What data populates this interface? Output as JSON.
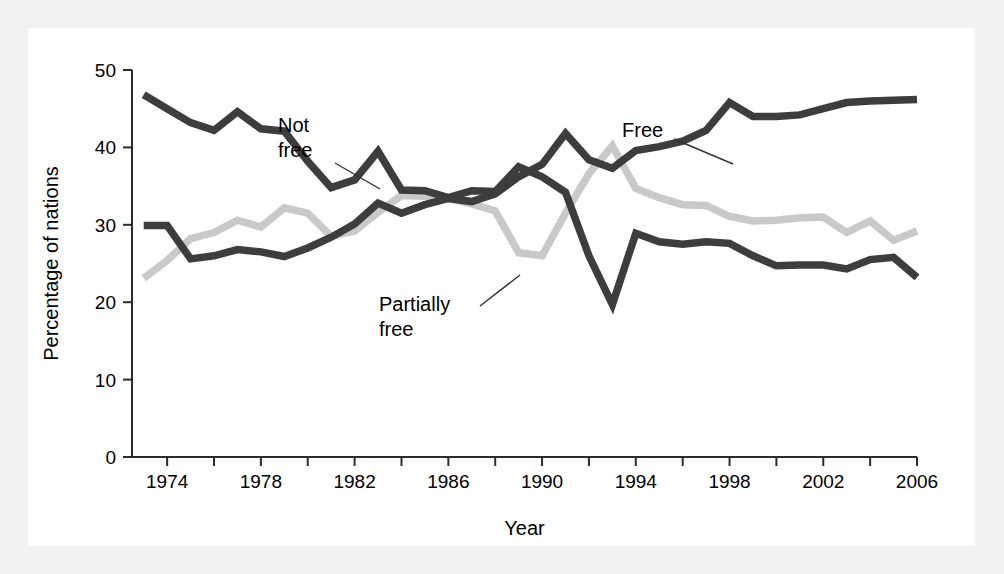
{
  "figure": {
    "background_color": "#f2f2f2",
    "panel_color": "#ffffff"
  },
  "chart_data": {
    "type": "line",
    "title": "",
    "xlabel": "Year",
    "ylabel": "Percentage of nations",
    "xlim": [
      1972.5,
      2006
    ],
    "ylim": [
      0,
      50
    ],
    "grid": false,
    "legend_position": "inline-annotations",
    "x_tick_labels": [
      "1974",
      "1978",
      "1982",
      "1986",
      "1990",
      "1994",
      "1998",
      "2002",
      "2006"
    ],
    "x_tick_values": [
      1974,
      1978,
      1982,
      1986,
      1990,
      1994,
      1998,
      2002,
      2006
    ],
    "x_minor_tick_values": [
      1976,
      1980,
      1984,
      1988,
      1992,
      1996,
      2000,
      2004
    ],
    "y_tick_labels": [
      "0",
      "10",
      "20",
      "30",
      "40",
      "50"
    ],
    "y_tick_values": [
      0,
      10,
      20,
      30,
      40,
      50
    ],
    "x": [
      1973,
      1974,
      1975,
      1976,
      1977,
      1978,
      1979,
      1980,
      1981,
      1982,
      1983,
      1984,
      1985,
      1986,
      1987,
      1988,
      1989,
      1990,
      1991,
      1992,
      1993,
      1994,
      1995,
      1996,
      1997,
      1998,
      1999,
      2000,
      2001,
      2002,
      2003,
      2004,
      2005,
      2006
    ],
    "series": [
      {
        "name": "Free",
        "label": "Free",
        "color": "#3d3d3d",
        "values": [
          29.9,
          29.9,
          25.6,
          26.0,
          26.8,
          26.5,
          25.9,
          27.0,
          28.4,
          30.1,
          32.8,
          31.5,
          32.6,
          33.4,
          33.0,
          34.0,
          36.2,
          37.8,
          41.8,
          38.4,
          37.3,
          39.6,
          40.1,
          40.8,
          42.2,
          45.8,
          44.0,
          44.0,
          44.2,
          45.0,
          45.8,
          46.0,
          46.1,
          46.2
        ]
      },
      {
        "name": "Partially free",
        "label": "Partially free",
        "color": "#c9c9c9",
        "values": [
          23.1,
          25.4,
          28.2,
          29.0,
          30.6,
          29.7,
          32.2,
          31.5,
          28.5,
          29.2,
          31.6,
          33.8,
          33.7,
          33.4,
          32.7,
          31.8,
          26.4,
          26.0,
          31.5,
          36.6,
          40.2,
          34.7,
          33.5,
          32.6,
          32.5,
          31.1,
          30.5,
          30.6,
          30.9,
          31.0,
          29.0,
          30.5,
          28.0,
          29.2
        ]
      },
      {
        "name": "Not free",
        "label": "Not free",
        "color": "#3d3d3d",
        "values": [
          46.8,
          45.0,
          43.2,
          42.2,
          44.6,
          42.4,
          42.1,
          38.2,
          34.8,
          35.8,
          39.5,
          34.5,
          34.4,
          33.5,
          34.4,
          34.3,
          37.5,
          36.2,
          34.2,
          26.0,
          19.7,
          28.9,
          27.8,
          27.5,
          27.8,
          27.6,
          26.0,
          24.7,
          24.8,
          24.8,
          24.3,
          25.5,
          25.8,
          23.2
        ]
      }
    ],
    "annotations": [
      {
        "text": "Not free",
        "lines": [
          "Not",
          "free"
        ],
        "target_year": 1983,
        "target_value": 39.5
      },
      {
        "text": "Free",
        "lines": [
          "Free"
        ],
        "target_year": 1996,
        "target_value": 40.8
      },
      {
        "text": "Partially free",
        "lines": [
          "Partially",
          "free"
        ],
        "target_year": 1990,
        "target_value": 26.0
      }
    ]
  }
}
